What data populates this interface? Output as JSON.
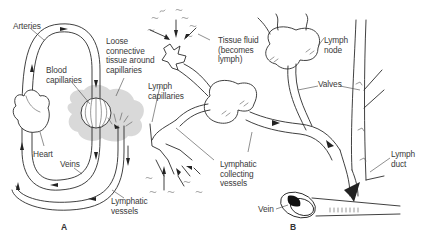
{
  "figure": {
    "panels": [
      {
        "id": "A",
        "label": "A",
        "annotations": [
          {
            "key": "arteries",
            "text": "Arteries"
          },
          {
            "key": "loose_tissue",
            "text": "Loose\nconnective\ntissue around\ncapillaries"
          },
          {
            "key": "blood_capillaries",
            "text": "Blood\ncapillaries"
          },
          {
            "key": "heart",
            "text": "Heart"
          },
          {
            "key": "veins",
            "text": "Veins"
          },
          {
            "key": "lymphatic_vessels",
            "text": "Lymphatic\nvessels"
          }
        ]
      },
      {
        "id": "B",
        "label": "B",
        "annotations": [
          {
            "key": "tissue_fluid",
            "text": "Tissue fluid\n(becomes\nlymph)"
          },
          {
            "key": "lymph_capillaries",
            "text": "Lymph\ncapillaries"
          },
          {
            "key": "lymphatic_collecting",
            "text": "Lymphatic\ncollecting\nvessels"
          },
          {
            "key": "lymph_node",
            "text": "Lymph\nnode"
          },
          {
            "key": "valves",
            "text": "Valves"
          },
          {
            "key": "lymph_duct",
            "text": "Lymph\nduct"
          },
          {
            "key": "vein",
            "text": "Vein"
          }
        ]
      }
    ],
    "colors": {
      "line": "#2b2b2b",
      "tissue_shading": "#d9d9d9",
      "text": "#3a3a3a",
      "background": "#ffffff"
    }
  }
}
